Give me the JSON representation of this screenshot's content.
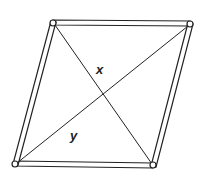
{
  "diagram": {
    "shape": "parallelogram frame (rhombus) made of rods with pinned corners",
    "vertices": {
      "top_left": [
        53,
        22
      ],
      "top_right": [
        190,
        23
      ],
      "bottom_right": [
        153,
        166
      ],
      "bottom_left": [
        15,
        164
      ]
    },
    "diagonals": [
      {
        "name": "x",
        "from": "top_left",
        "to": "bottom_right"
      },
      {
        "name": "y",
        "from": "bottom_left",
        "to": "top_right"
      }
    ],
    "labels": {
      "x": "x",
      "y": "y"
    },
    "colors": {
      "stroke": "#222222",
      "fill": "#ffffff"
    }
  }
}
